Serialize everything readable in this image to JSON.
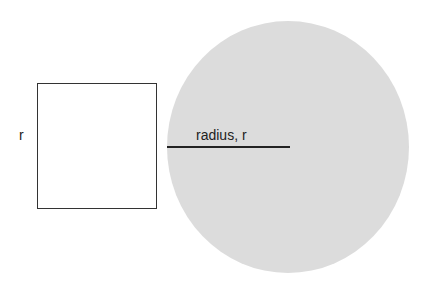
{
  "diagram": {
    "square": {
      "side_label": "r"
    },
    "circle": {
      "radius_label": "radius, r",
      "fill_color": "#dcdcdc"
    }
  }
}
